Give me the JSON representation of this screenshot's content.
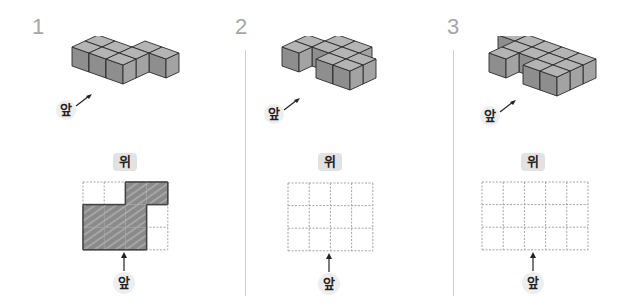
{
  "problems": [
    {
      "number": "1",
      "front_label": "앞",
      "top_label": "위",
      "bottom_label": "앞",
      "grid": {
        "cols": 4,
        "rows": 3
      },
      "top_view_shaded": [
        [
          0,
          0,
          1,
          1
        ],
        [
          1,
          1,
          1,
          0
        ],
        [
          1,
          1,
          1,
          0
        ]
      ],
      "cubes": [
        [
          0,
          1
        ],
        [
          1,
          1
        ],
        [
          2,
          1
        ],
        [
          0,
          2
        ],
        [
          1,
          2
        ],
        [
          2,
          2
        ],
        [
          2,
          0
        ],
        [
          3,
          0
        ]
      ]
    },
    {
      "number": "2",
      "front_label": "앞",
      "top_label": "위",
      "bottom_label": "앞",
      "grid": {
        "cols": 4,
        "rows": 3
      },
      "top_view_shaded": [],
      "cubes": [
        [
          1,
          0
        ],
        [
          2,
          0
        ],
        [
          0,
          1
        ],
        [
          1,
          1
        ],
        [
          2,
          1
        ],
        [
          3,
          1
        ],
        [
          0,
          2
        ],
        [
          2,
          2
        ],
        [
          3,
          2
        ]
      ]
    },
    {
      "number": "3",
      "front_label": "앞",
      "top_label": "위",
      "bottom_label": "앞",
      "grid": {
        "cols": 5,
        "rows": 3
      },
      "top_view_shaded": [],
      "cubes": [
        [
          0,
          0
        ],
        [
          1,
          0
        ],
        [
          2,
          0
        ],
        [
          3,
          0
        ],
        [
          4,
          0
        ],
        [
          1,
          1
        ],
        [
          2,
          1
        ],
        [
          3,
          1
        ],
        [
          4,
          1
        ],
        [
          1,
          2
        ],
        [
          3,
          2
        ],
        [
          4,
          2
        ]
      ]
    }
  ],
  "colors": {
    "cube_front": "#8e8e8e",
    "cube_side": "#a3a3a3",
    "cube_top": "#b4b4b4",
    "cube_edge": "#2b2b2b",
    "shade": "#8a8a8a",
    "grid_dash": "#9a9a9a",
    "number": "#a6a6a6",
    "divider": "#cfcfcf"
  }
}
